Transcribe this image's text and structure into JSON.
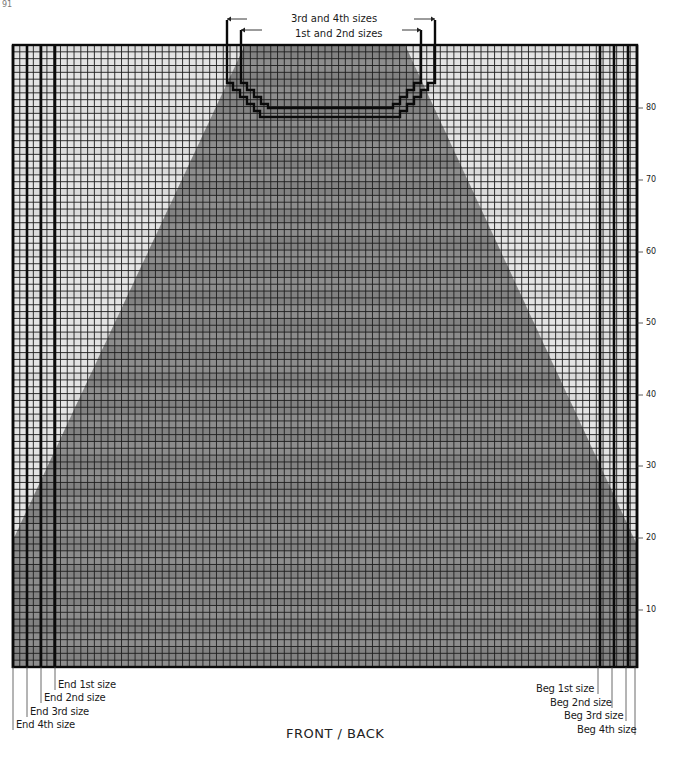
{
  "page_number": "91",
  "header": {
    "neck_outer_label": "3rd and 4th sizes",
    "neck_inner_label": "1st and 2nd sizes"
  },
  "caption": "FRONT / BACK",
  "row_ticks": [
    {
      "label": "10",
      "y": 610
    },
    {
      "label": "20",
      "y": 538
    },
    {
      "label": "30",
      "y": 466
    },
    {
      "label": "40",
      "y": 395
    },
    {
      "label": "50",
      "y": 323
    },
    {
      "label": "60",
      "y": 252
    },
    {
      "label": "70",
      "y": 180
    },
    {
      "label": "80",
      "y": 108
    }
  ],
  "end_labels": [
    {
      "label": "End 1st size",
      "x": 58,
      "y": 685
    },
    {
      "label": "End 2nd size",
      "x": 44,
      "y": 698
    },
    {
      "label": "End 3rd size",
      "x": 30,
      "y": 712
    },
    {
      "label": "End 4th size",
      "x": 16,
      "y": 725
    }
  ],
  "beg_labels": [
    {
      "label": "Beg 1st size",
      "x": 536,
      "y": 689
    },
    {
      "label": "Beg 2nd size",
      "x": 550,
      "y": 703
    },
    {
      "label": "Beg 3rd size",
      "x": 564,
      "y": 716
    },
    {
      "label": "Beg 4th size",
      "x": 577,
      "y": 730
    }
  ],
  "colors": {
    "light_cell": "#e4e4e4",
    "dark_cell": "#8d8d8d",
    "grid_line": "#1e1e1e",
    "heavy_line": "#0a0a0a"
  },
  "grid": {
    "left": 13,
    "top": 45,
    "right": 637,
    "bottom": 667,
    "cols": 92,
    "rows": 91,
    "left_size_lines": [
      13,
      27,
      41,
      55
    ],
    "right_size_lines": [
      600,
      614,
      628,
      637
    ],
    "dark_region": [
      [
        245,
        45
      ],
      [
        405,
        45
      ],
      [
        637,
        545
      ],
      [
        637,
        667
      ],
      [
        13,
        667
      ],
      [
        13,
        540
      ]
    ]
  },
  "neckline": {
    "outer": [
      [
        227,
        20
      ],
      [
        227,
        83
      ],
      [
        233,
        83
      ],
      [
        233,
        90
      ],
      [
        240,
        90
      ],
      [
        240,
        97
      ],
      [
        247,
        97
      ],
      [
        247,
        104
      ],
      [
        254,
        104
      ],
      [
        254,
        111
      ],
      [
        260,
        111
      ],
      [
        260,
        117
      ],
      [
        400,
        117
      ],
      [
        400,
        111
      ],
      [
        407,
        111
      ],
      [
        407,
        104
      ],
      [
        414,
        104
      ],
      [
        414,
        97
      ],
      [
        421,
        97
      ],
      [
        421,
        90
      ],
      [
        428,
        90
      ],
      [
        428,
        83
      ],
      [
        435,
        83
      ],
      [
        435,
        20
      ]
    ],
    "inner": [
      [
        241,
        30
      ],
      [
        241,
        83
      ],
      [
        247,
        83
      ],
      [
        247,
        90
      ],
      [
        254,
        90
      ],
      [
        254,
        97
      ],
      [
        261,
        97
      ],
      [
        261,
        104
      ],
      [
        268,
        104
      ],
      [
        268,
        108
      ],
      [
        393,
        108
      ],
      [
        393,
        104
      ],
      [
        400,
        104
      ],
      [
        400,
        97
      ],
      [
        407,
        97
      ],
      [
        407,
        90
      ],
      [
        414,
        90
      ],
      [
        414,
        83
      ],
      [
        421,
        83
      ],
      [
        421,
        30
      ]
    ],
    "outer_arrow_y": 19,
    "inner_arrow_y": 30
  }
}
